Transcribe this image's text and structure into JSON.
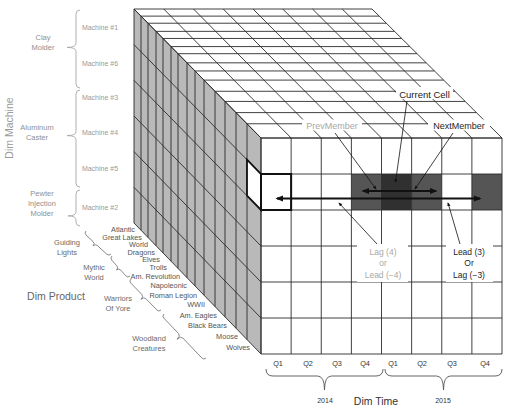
{
  "diagram": {
    "dim_machine": {
      "title": "Dim Machine",
      "groups": [
        {
          "label_lines": [
            "Clay",
            "Molder"
          ],
          "machines": [
            "Machine #1",
            "Machine #6"
          ]
        },
        {
          "label_lines": [
            "Aluminum",
            "Caster"
          ],
          "machines": [
            "Machine #3",
            "Machine #4",
            "Machine #5"
          ]
        },
        {
          "label_lines": [
            "Pewter",
            "Injection",
            "Molder"
          ],
          "machines": [
            "Machine #2"
          ]
        }
      ]
    },
    "dim_product": {
      "title": "Dim Product",
      "groups": [
        {
          "label_lines": [
            "Guiding",
            "Lights"
          ]
        },
        {
          "label_lines": [
            "Mythic",
            "World"
          ]
        },
        {
          "label_lines": [
            "Warriors",
            "Of Yore"
          ]
        },
        {
          "label_lines": [
            "Woodland",
            "Creatures"
          ]
        }
      ],
      "products": [
        "Atlantic",
        "Great Lakes",
        "World",
        "Dragons",
        "Elves",
        "Trolls",
        "Am. Revolution",
        "Napoleonic",
        "Roman Legion",
        "WWII",
        "Am. Eagles",
        "Black Bears",
        "Moose",
        "Wolves"
      ]
    },
    "dim_time": {
      "title": "Dim Time",
      "years": [
        "2014",
        "2015"
      ],
      "quarters": [
        "Q1",
        "Q2",
        "Q3",
        "Q4",
        "Q1",
        "Q2",
        "Q3",
        "Q4"
      ]
    },
    "annotations": {
      "current_cell": "Current Cell",
      "prev_member": "PrevMember",
      "next_member": "NextMember",
      "lag": [
        "Lag (4)",
        "or",
        "Lead (−4)"
      ],
      "lead": [
        "Lead (3)",
        "Or",
        "Lag (−3)"
      ]
    },
    "highlight": {
      "row_index": 1,
      "cells": [
        "outlined",
        "empty",
        "empty",
        "related",
        "current",
        "related",
        "empty",
        "related"
      ]
    },
    "colors": {
      "side_face": "#b9b9b9",
      "grid_line": "#2b2b2b",
      "cell_related": "#555555",
      "cell_current": "#303030",
      "arrow": "#111111"
    }
  }
}
